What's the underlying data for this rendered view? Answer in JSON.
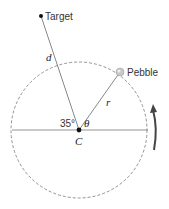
{
  "diagram": {
    "labels": {
      "target": "Target",
      "pebble": "Pebble",
      "distance": "d",
      "radius": "r",
      "angle_fixed": "35°",
      "angle_var": "θ",
      "center": "C"
    },
    "colors": {
      "line": "#555555",
      "circle": "#777777",
      "arrow": "#444444",
      "pebble": "#c8c8c8"
    }
  }
}
